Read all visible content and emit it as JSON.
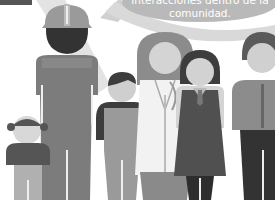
{
  "caption": {
    "line1": "interacciones dentro de la",
    "line2": "comunidad."
  },
  "colors": {
    "background": "#ffffff",
    "bubble": "#b9b9b9",
    "arrow": "#d6d6d6",
    "dark": "#3f3f3f",
    "mid": "#7a7a7a",
    "light": "#9c9c9c",
    "skin": "#cfcfcf",
    "pale": "#e2e2e2"
  },
  "figures": [
    {
      "id": "construction-worker",
      "description": "adult with hard hat and overalls"
    },
    {
      "id": "girl",
      "description": "small girl with pigtails"
    },
    {
      "id": "boy",
      "description": "boy in overalls"
    },
    {
      "id": "doctor",
      "description": "woman with stethoscope and lab coat"
    },
    {
      "id": "student",
      "description": "girl in school uniform with tie"
    },
    {
      "id": "adult-right",
      "description": "adult partially cropped at right edge"
    }
  ]
}
